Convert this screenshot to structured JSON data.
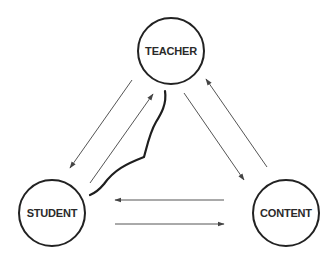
{
  "diagram": {
    "title": "",
    "nodes": [
      {
        "id": "teacher",
        "label": "TEACHER",
        "cx": 171,
        "cy": 51,
        "r": 33
      },
      {
        "id": "student",
        "label": "STUDENT",
        "cx": 52,
        "cy": 213,
        "r": 33
      },
      {
        "id": "content",
        "label": "CONTENT",
        "cx": 286,
        "cy": 213,
        "r": 33
      }
    ],
    "edges": [
      {
        "id": "teacher-to-student",
        "from": "teacher",
        "to": "student",
        "x1": 132,
        "y1": 80,
        "x2": 70,
        "y2": 168
      },
      {
        "id": "student-to-teacher",
        "from": "student",
        "to": "teacher",
        "x1": 90,
        "y1": 183,
        "x2": 153,
        "y2": 94
      },
      {
        "id": "teacher-to-content",
        "from": "teacher",
        "to": "content",
        "x1": 184,
        "y1": 93,
        "x2": 244,
        "y2": 180
      },
      {
        "id": "content-to-teacher",
        "from": "content",
        "to": "teacher",
        "x1": 267,
        "y1": 167,
        "x2": 206,
        "y2": 79
      },
      {
        "id": "content-to-student",
        "from": "content",
        "to": "student",
        "x1": 224,
        "y1": 200,
        "x2": 115,
        "y2": 200
      },
      {
        "id": "student-to-content",
        "from": "student",
        "to": "content",
        "x1": 115,
        "y1": 224,
        "x2": 224,
        "y2": 224
      }
    ],
    "barrier": {
      "id": "barrier-curve",
      "between": [
        "teacher",
        "student"
      ],
      "path": "M165,91 C167,104 161,114 156,122 C150,132 147,146 144,157 C126,164 114,170 104,184 C99,190 95,193 90,195"
    },
    "colors": {
      "node_stroke": "#222222",
      "edge_stroke": "#555555",
      "barrier_stroke": "#1e1e1e",
      "label_fill": "#2a2a2a",
      "background": "#ffffff"
    }
  }
}
